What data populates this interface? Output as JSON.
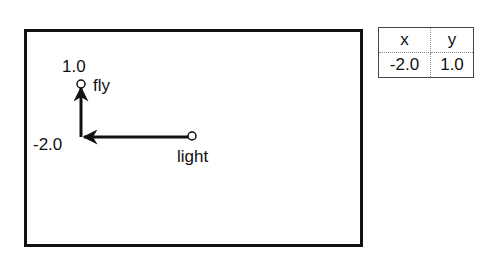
{
  "diagram": {
    "nodes": [
      {
        "id": "fly",
        "label": "fly"
      },
      {
        "id": "light",
        "label": "light"
      }
    ],
    "axis_labels": {
      "y_value": "1.0",
      "x_value": "-2.0"
    },
    "arrows": [
      {
        "from": "light",
        "to": "origin",
        "direction": "left"
      },
      {
        "from": "origin",
        "to": "fly",
        "direction": "up"
      }
    ]
  },
  "table": {
    "headers": [
      "x",
      "y"
    ],
    "rows": [
      [
        "-2.0",
        "1.0"
      ]
    ]
  }
}
